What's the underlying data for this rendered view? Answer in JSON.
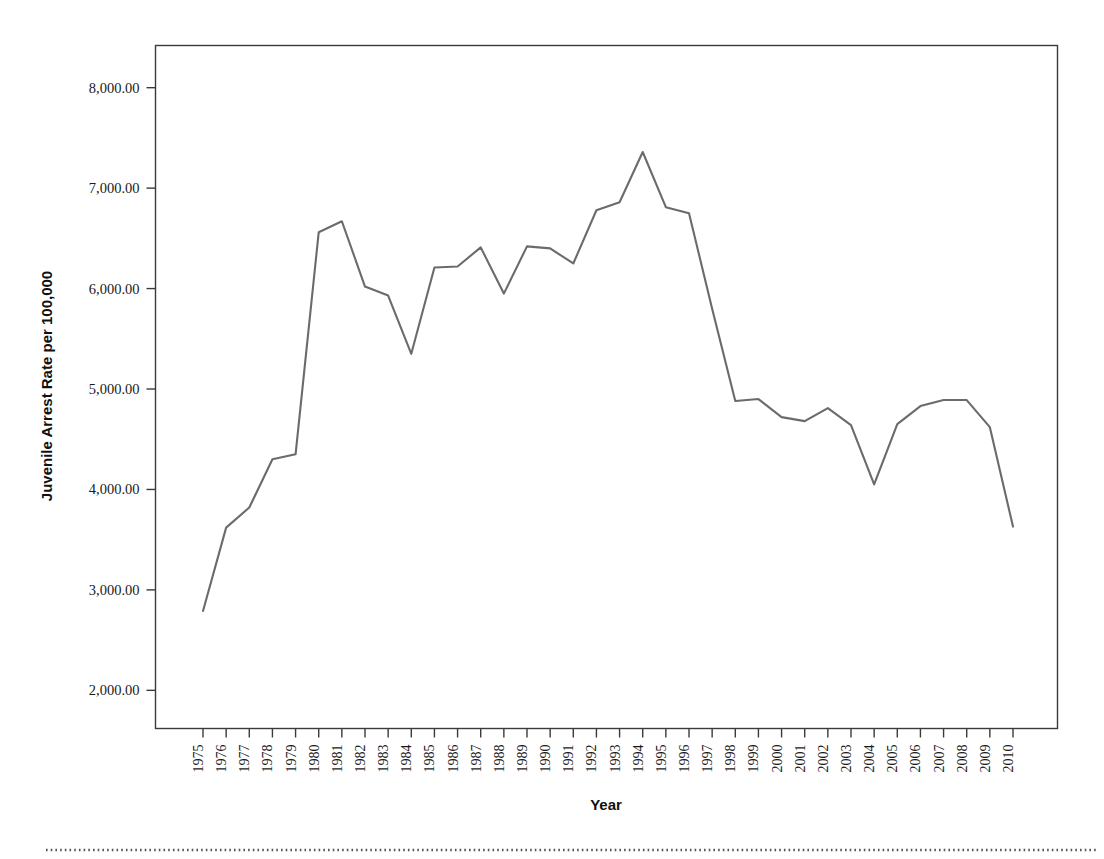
{
  "chart_data": {
    "type": "line",
    "title": "",
    "xlabel": "Year",
    "ylabel": "Juvenile Arrest Rate per 100,000",
    "series_name": "Juvenile Arrest Rate",
    "line_color": "#6b6b6b",
    "grid": false,
    "legend": false,
    "xlim": [
      1975,
      2010
    ],
    "ylim": [
      1620,
      8420
    ],
    "ytick_values": [
      2000,
      3000,
      4000,
      5000,
      6000,
      7000,
      8000
    ],
    "ytick_labels": [
      "2,000.00",
      "3,000.00",
      "4,000.00",
      "5,000.00",
      "6,000.00",
      "7,000.00",
      "8,000.00"
    ],
    "categories": [
      "1975",
      "1976",
      "1977",
      "1978",
      "1979",
      "1980",
      "1981",
      "1982",
      "1983",
      "1984",
      "1985",
      "1986",
      "1987",
      "1988",
      "1989",
      "1990",
      "1991",
      "1992",
      "1993",
      "1994",
      "1995",
      "1996",
      "1997",
      "1998",
      "1999",
      "2000",
      "2001",
      "2002",
      "2003",
      "2004",
      "2005",
      "2006",
      "2007",
      "2008",
      "2009",
      "2010"
    ],
    "values": [
      2790,
      3620,
      3820,
      4300,
      4350,
      6560,
      6670,
      6020,
      5930,
      5350,
      6210,
      6220,
      6410,
      5950,
      6420,
      6400,
      6250,
      6780,
      6860,
      7360,
      6810,
      6750,
      5800,
      4880,
      4900,
      4720,
      4680,
      4810,
      4640,
      4050,
      4650,
      4830,
      4890,
      4890,
      4620,
      3630
    ]
  },
  "footer": {
    "divider_style": "dotted"
  }
}
